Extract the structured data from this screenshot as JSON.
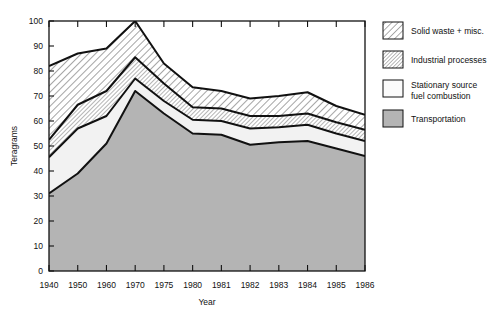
{
  "chart_data": {
    "type": "area",
    "title": "",
    "xlabel": "Year",
    "ylabel": "Teragrams",
    "categories": [
      "1940",
      "1950",
      "1960",
      "1970",
      "1975",
      "1980",
      "1981",
      "1982",
      "1983",
      "1984",
      "1985",
      "1986"
    ],
    "ylim": [
      0,
      100
    ],
    "yticks": [
      0,
      10,
      20,
      30,
      40,
      50,
      60,
      70,
      80,
      90,
      100
    ],
    "grid": false,
    "stacked": true,
    "legend_position": "right",
    "series": [
      {
        "name": "Transportation",
        "fill": "#b4b4b4",
        "pattern": "solid",
        "values": [
          31,
          39,
          51,
          72,
          63,
          55,
          54.5,
          50.5,
          51.5,
          52,
          49,
          46
        ]
      },
      {
        "name": "Stationary source fuel combustion",
        "fill": "#f2f2f2",
        "pattern": "plain",
        "values": [
          14.5,
          18,
          11,
          5,
          5,
          5.5,
          5.5,
          6.5,
          6,
          6.5,
          6,
          6
        ]
      },
      {
        "name": "Industrial processes",
        "fill": "#ffffff",
        "pattern": "diagonal-fine",
        "values": [
          7,
          9.5,
          10,
          8.5,
          7,
          5,
          5,
          5,
          4.5,
          4.5,
          4.5,
          4.5
        ]
      },
      {
        "name": "Solid waste + misc.",
        "fill": "#ffffff",
        "pattern": "diagonal-coarse",
        "values": [
          29.5,
          20.5,
          17,
          14.5,
          8,
          8,
          7,
          7,
          8,
          8.5,
          6.5,
          6
        ]
      }
    ],
    "cumulative_tops": {
      "transportation": [
        31,
        39,
        51,
        72,
        63,
        55,
        54.5,
        50.5,
        51.5,
        52,
        49,
        46
      ],
      "stationary_top": [
        45.5,
        57,
        62,
        77,
        68,
        60.5,
        60,
        57,
        57.5,
        58.5,
        55,
        52
      ],
      "industrial_top": [
        52.5,
        66.5,
        72,
        85.5,
        75,
        65.5,
        65,
        62,
        62,
        63,
        59.5,
        56.5
      ],
      "total": [
        82,
        87,
        89,
        100,
        83,
        73.5,
        72,
        69,
        70,
        71.5,
        66,
        62.5
      ]
    }
  },
  "legend": {
    "items": [
      {
        "label": "Solid waste + misc.",
        "swatch": "diagonal-coarse"
      },
      {
        "label": "Industrial processes",
        "swatch": "diagonal-fine"
      },
      {
        "label": "Stationary source",
        "label2": "fuel combustion",
        "swatch": "plain"
      },
      {
        "label": "Transportation",
        "swatch": "solid"
      }
    ]
  }
}
